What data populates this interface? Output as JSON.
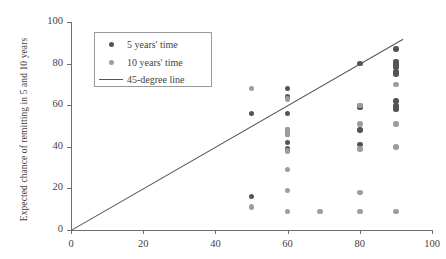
{
  "chart_data": {
    "type": "scatter",
    "title": "",
    "xlabel": "",
    "ylabel": "Expected chance of remitting in 5 and 10 years",
    "xlim": [
      0,
      100
    ],
    "ylim": [
      0,
      100
    ],
    "xticks": [
      0,
      20,
      40,
      60,
      80,
      100
    ],
    "yticks": [
      0,
      20,
      40,
      60,
      80,
      100
    ],
    "grid": false,
    "legend_position": "upper-left-inside",
    "legend": [
      {
        "key": "dot",
        "color": "#545454",
        "label": "5 years' time"
      },
      {
        "key": "dot",
        "color": "#9d9d9d",
        "label": "10 years' time"
      },
      {
        "key": "line",
        "color": "#555555",
        "label": "45-degree line"
      }
    ],
    "annotations": [
      {
        "type": "line",
        "name": "45-degree line",
        "x": [
          0,
          92
        ],
        "y": [
          0,
          92
        ],
        "color": "#555555"
      }
    ],
    "series": [
      {
        "name": "5 years' time",
        "color": "#545454",
        "points": [
          [
            50,
            56
          ],
          [
            50,
            16
          ],
          [
            60,
            68
          ],
          [
            60,
            64
          ],
          [
            60,
            56
          ],
          [
            60,
            48
          ],
          [
            60,
            46
          ],
          [
            60,
            42
          ],
          [
            60,
            39
          ],
          [
            80,
            80
          ],
          [
            80,
            60
          ],
          [
            80,
            59
          ],
          [
            80,
            48
          ],
          [
            80,
            41
          ],
          [
            90,
            87
          ],
          [
            90,
            81
          ],
          [
            90,
            80
          ],
          [
            90,
            79
          ],
          [
            90,
            78
          ],
          [
            90,
            76
          ],
          [
            90,
            75
          ],
          [
            90,
            62
          ],
          [
            90,
            60
          ],
          [
            90,
            59
          ],
          [
            90,
            58
          ]
        ]
      },
      {
        "name": "10 years' time",
        "color": "#9d9d9d",
        "points": [
          [
            50,
            68
          ],
          [
            50,
            11
          ],
          [
            60,
            63
          ],
          [
            60,
            48
          ],
          [
            60,
            46
          ],
          [
            60,
            38
          ],
          [
            60,
            29
          ],
          [
            60,
            19
          ],
          [
            60,
            9
          ],
          [
            69,
            9
          ],
          [
            80,
            60
          ],
          [
            80,
            51
          ],
          [
            80,
            39
          ],
          [
            80,
            18
          ],
          [
            80,
            9
          ],
          [
            90,
            70
          ],
          [
            90,
            51
          ],
          [
            90,
            40
          ],
          [
            90,
            9
          ]
        ]
      }
    ]
  }
}
